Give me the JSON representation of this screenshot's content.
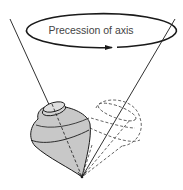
{
  "diagram": {
    "title": "Precession of axis",
    "label": "Precession of axis",
    "colors": {
      "line": "#1a1a1a",
      "top_fill": "#c8c8c8",
      "dashed": "#555555",
      "label_text": "#444444"
    }
  }
}
